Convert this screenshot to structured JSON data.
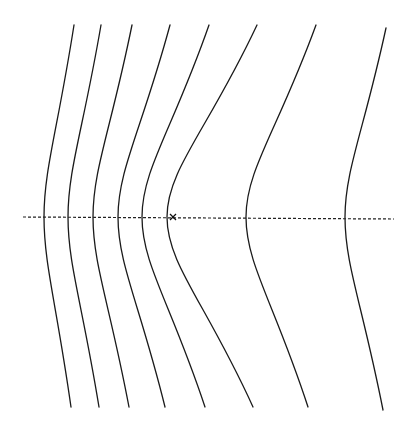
{
  "diagram": {
    "axis": {
      "x1": 23,
      "y1": 217,
      "x2": 394,
      "y2": 219,
      "style": "dashed"
    },
    "marker": {
      "symbol": "x",
      "x": 173,
      "y": 217
    },
    "curves": [
      {
        "id": 1,
        "top": [
          74,
          25
        ],
        "vertex": [
          44,
          217
        ],
        "bottom": [
          71,
          407
        ]
      },
      {
        "id": 2,
        "top": [
          101,
          25
        ],
        "vertex": [
          68,
          217
        ],
        "bottom": [
          99,
          407
        ]
      },
      {
        "id": 3,
        "top": [
          132,
          25
        ],
        "vertex": [
          93,
          217
        ],
        "bottom": [
          129,
          407
        ]
      },
      {
        "id": 4,
        "top": [
          170,
          25
        ],
        "vertex": [
          118,
          217
        ],
        "bottom": [
          165,
          407
        ]
      },
      {
        "id": 5,
        "top": [
          209,
          25
        ],
        "vertex": [
          142,
          217
        ],
        "bottom": [
          205,
          407
        ]
      },
      {
        "id": 6,
        "top": [
          257,
          25
        ],
        "vertex": [
          167,
          217
        ],
        "bottom": [
          253,
          407
        ]
      },
      {
        "id": 7,
        "top": [
          316,
          25
        ],
        "vertex": [
          246,
          217
        ],
        "bottom": [
          308,
          407
        ]
      },
      {
        "id": 8,
        "top": [
          386,
          28
        ],
        "vertex": [
          345,
          217
        ],
        "bottom": [
          383,
          410
        ]
      }
    ],
    "colors": {
      "line": "#1a1a1a",
      "background": "#ffffff"
    }
  }
}
